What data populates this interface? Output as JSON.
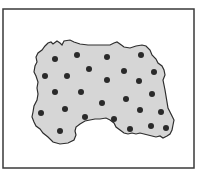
{
  "figure": {
    "frame": {
      "x": 3,
      "y": 9,
      "width": 191,
      "height": 159,
      "stroke": "#3a3a3a"
    },
    "region": {
      "fill": "#d6d6d6",
      "stroke": "#2e2e2e",
      "path": "M45,46 L48,43 L51,42 L53,44 L57,41 L60,43 L62,45 L64,41 L70,40 L74,42 L80,44 L88,45 L100,45 L110,45 L114,43 L117,42 L120,44 L124,47 L130,48 L136,46 L142,45 L146,46 L150,50 L152,55 L156,59 L158,63 L162,66 L164,70 L165,75 L163,80 L164,85 L165,90 L166,96 L167,102 L168,108 L170,112 L172,116 L174,120 L173,125 L172,130 L170,134 L167,136 L163,138 L160,136 L156,137 L152,136 L148,135 L144,134 L140,133 L136,134 L132,133 L128,134 L124,133 L120,130 L116,127 L114,123 L110,120 L106,118 L100,119 L95,119 L90,120 L85,121 L80,124 L76,127 L75,131 L76,135 L74,140 L68,143 L60,144 L53,142 L48,137 L43,133 L40,129 L36,126 L34,122 L32,117 L33,112 L34,106 L37,100 L38,94 L37,88 L38,82 L36,76 L34,72 L35,66 L37,62 L36,57 L38,53 L42,50 Z"
    },
    "dot_color": "#2a2a2a",
    "dot_radius": 3,
    "dots": [
      {
        "x": 55,
        "y": 59
      },
      {
        "x": 77,
        "y": 55
      },
      {
        "x": 107,
        "y": 57
      },
      {
        "x": 141,
        "y": 55
      },
      {
        "x": 45,
        "y": 76
      },
      {
        "x": 67,
        "y": 76
      },
      {
        "x": 89,
        "y": 69
      },
      {
        "x": 124,
        "y": 71
      },
      {
        "x": 154,
        "y": 72
      },
      {
        "x": 107,
        "y": 80
      },
      {
        "x": 139,
        "y": 81
      },
      {
        "x": 55,
        "y": 92
      },
      {
        "x": 81,
        "y": 92
      },
      {
        "x": 152,
        "y": 94
      },
      {
        "x": 102,
        "y": 103
      },
      {
        "x": 126,
        "y": 99
      },
      {
        "x": 65,
        "y": 109
      },
      {
        "x": 41,
        "y": 113
      },
      {
        "x": 140,
        "y": 110
      },
      {
        "x": 161,
        "y": 112
      },
      {
        "x": 85,
        "y": 117
      },
      {
        "x": 114,
        "y": 119
      },
      {
        "x": 60,
        "y": 131
      },
      {
        "x": 130,
        "y": 129
      },
      {
        "x": 151,
        "y": 126
      },
      {
        "x": 166,
        "y": 128
      }
    ]
  }
}
